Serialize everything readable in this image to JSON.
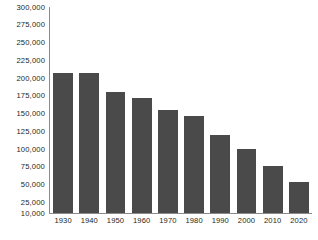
{
  "chart_data": {
    "type": "bar",
    "title": "",
    "subtitle": "",
    "xlabel": "",
    "ylabel": "",
    "categories": [
      "1930",
      "1940",
      "1950",
      "1960",
      "1970",
      "1980",
      "1990",
      "2000",
      "2010",
      "2020"
    ],
    "values": [
      207000,
      207000,
      180000,
      172000,
      155000,
      146000,
      120000,
      100000,
      76000,
      54000
    ],
    "series": [
      {
        "name": "",
        "values": [
          207000,
          207000,
          180000,
          172000,
          155000,
          146000,
          120000,
          100000,
          76000,
          54000
        ]
      }
    ],
    "ylim": [
      10000,
      300000
    ],
    "y_ticks": [
      10000,
      25000,
      50000,
      75000,
      100000,
      125000,
      150000,
      175000,
      200000,
      225000,
      250000,
      275000,
      300000
    ],
    "y_tick_labels": [
      "10,000",
      "25,000",
      "50,000",
      "75,000",
      "100,000",
      "125,000",
      "150,000",
      "175,000",
      "200,000",
      "225,000",
      "250,000",
      "275,000",
      "300,000"
    ],
    "x_tick_labels": [
      "1930",
      "1940",
      "1950",
      "1960",
      "1970",
      "1980",
      "1990",
      "2000",
      "2010",
      "2020"
    ],
    "grid": false,
    "legend": false,
    "legend_position": "none",
    "annotations": [],
    "colors": {
      "bar": "#4a4a4a",
      "axis": "#8a8a8a",
      "text": "#231f20",
      "background": "#ffffff"
    }
  }
}
